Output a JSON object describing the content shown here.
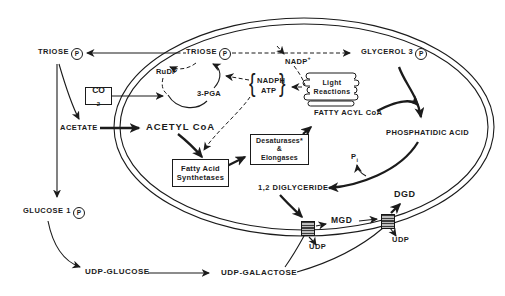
{
  "figure": {
    "bg": "#ffffff",
    "ink": "#1b1b1b"
  },
  "metabolites": {
    "triose_out": {
      "text": "TRIOSE",
      "p": "P"
    },
    "triose_in": {
      "text": "TRIOSE",
      "p": "P"
    },
    "glycerol3p": {
      "text": "GLYCEROL 3",
      "p": "P"
    },
    "glucose1p": {
      "text": "GLUCOSE 1",
      "p": "P"
    },
    "nadp": {
      "base": "NADP",
      "sup": "+"
    },
    "nadph": "NADPH",
    "atp": "ATP",
    "brace_open": "{",
    "brace_close": "}",
    "rudp": "RuDP",
    "pga": "3-PGA",
    "co2": {
      "base": "CO",
      "sub": "2"
    },
    "acetate": "ACETATE",
    "acetyl_coa": "ACETYL CoA",
    "fatty_acyl_coa": "FATTY ACYL CoA",
    "phosphatidic_acid": "PHOSPHATIDIC ACID",
    "pi": {
      "base": "P",
      "sub": "i"
    },
    "diglyceride": "1,2 DIGLYCERIDE",
    "mgd": "MGD",
    "dgd": "DGD",
    "udp_site1": "UDP",
    "udp_site2": "UDP",
    "udp_glucose": "UDP-GLUCOSE",
    "udp_galactose": "UDP-GALACTOSE"
  },
  "enzymes": {
    "light_reactions": {
      "line1": "Light",
      "line2": "Reactions"
    },
    "fatty_acid_synthetases": {
      "line1": "Fatty Acid",
      "line2": "Synthetases"
    },
    "desaturases_elongases": {
      "line1": "Desaturases*",
      "line2": "&",
      "line3": "Elongases"
    }
  }
}
